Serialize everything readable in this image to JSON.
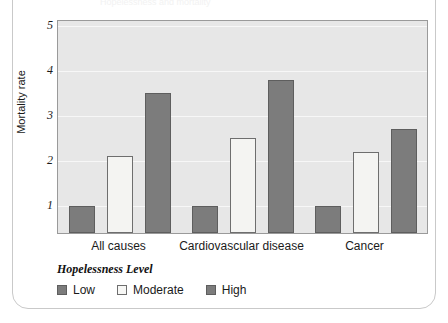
{
  "figure": {
    "caption_faint": "Hopelessness and mortality",
    "frame_color": "#c9c9c9"
  },
  "chart_data": {
    "type": "bar",
    "title": "",
    "xlabel": "",
    "ylabel": "Mortality rate",
    "categories": [
      "All causes",
      "Cardiovascular disease",
      "Cancer"
    ],
    "series": [
      {
        "name": "Low",
        "values": [
          1.0,
          1.0,
          1.0
        ],
        "color": "#7c7c7c"
      },
      {
        "name": "Moderate",
        "values": [
          2.1,
          2.5,
          2.2
        ],
        "color": "#f4f4f2"
      },
      {
        "name": "High",
        "values": [
          3.5,
          3.8,
          2.7
        ],
        "color": "#7c7c7c"
      }
    ],
    "yticks": [
      "5",
      "4",
      "3",
      "2",
      "1"
    ],
    "ytick_values": [
      5,
      4,
      3,
      2,
      1
    ],
    "ylim": [
      0.4,
      5.1
    ],
    "grid": true,
    "legend_position": "below",
    "legend_title": "Hopelessness Level",
    "plot_background": "#e7e7e7",
    "gridline_color": "#f7f7f7"
  },
  "legend": {
    "title": "Hopelessness Level",
    "items": [
      {
        "label": "Low",
        "swatch": "low-swatch"
      },
      {
        "label": "Moderate",
        "swatch": "moderate-swatch"
      },
      {
        "label": "High",
        "swatch": "high-swatch"
      }
    ]
  }
}
